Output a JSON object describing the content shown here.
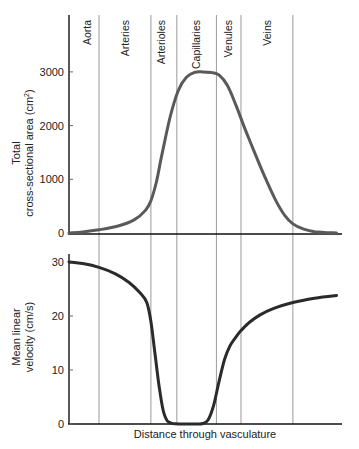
{
  "chart_data": [
    {
      "type": "line",
      "title": "",
      "xlabel": "",
      "ylabel": "Total cross-sectional area (cm²)",
      "ylabel_lines": [
        "Total",
        "cross-sectional area (cm²)"
      ],
      "ylim": [
        0,
        3500
      ],
      "yticks": [
        0,
        1000,
        2000,
        3000
      ],
      "ytick_labels": [
        "0",
        "1000",
        "2000",
        "3000"
      ],
      "grid": false,
      "line_color": "#5a5a5a",
      "x": [
        0,
        5,
        11,
        18,
        24,
        28,
        30,
        32,
        34,
        37,
        40,
        43,
        46,
        49,
        52,
        55,
        58,
        61,
        64,
        67,
        70,
        73,
        76,
        79,
        82,
        86,
        90,
        94,
        98
      ],
      "values": [
        0,
        20,
        60,
        130,
        250,
        420,
        600,
        950,
        1450,
        2150,
        2650,
        2900,
        2990,
        3000,
        2990,
        2940,
        2750,
        2400,
        2000,
        1620,
        1250,
        900,
        580,
        330,
        170,
        70,
        25,
        8,
        0
      ]
    },
    {
      "type": "line",
      "title": "",
      "xlabel": "Distance through vasculature",
      "ylabel": "Mean linear velocity (cm/s)",
      "ylabel_lines": [
        "Mean linear",
        "velocity (cm/s)"
      ],
      "ylim": [
        0,
        32
      ],
      "yticks": [
        0,
        10,
        20,
        30
      ],
      "ytick_labels": [
        "0",
        "10",
        "20",
        "30"
      ],
      "grid": false,
      "line_color": "#2a2a2a",
      "x": [
        0,
        5,
        11,
        17,
        22,
        26,
        28.5,
        30,
        31.5,
        33,
        34.5,
        36,
        38,
        41,
        44,
        47,
        49,
        51,
        53,
        55,
        57,
        59,
        61,
        63,
        66,
        70,
        75,
        82,
        90,
        98
      ],
      "values": [
        30,
        29.7,
        29,
        27.8,
        26.2,
        24.3,
        22.5,
        19,
        13,
        7,
        2.5,
        0.6,
        0.1,
        0,
        0,
        0,
        0.1,
        0.8,
        3.5,
        8,
        12,
        14.5,
        16,
        17.3,
        18.8,
        20.2,
        21.4,
        22.5,
        23.3,
        23.8
      ]
    }
  ],
  "segments": {
    "labels": [
      "Aorta",
      "Arteries",
      "Arterioles",
      "Capillaries",
      "Venules",
      "Veins"
    ],
    "boundaries_x": [
      11,
      30,
      39.5,
      54,
      63,
      82
    ]
  },
  "top_panel": {
    "ylabel_line1": "Total",
    "ylabel_line2": "cross-sectional area (cm²)",
    "ticks": [
      "0",
      "1000",
      "2000",
      "3000"
    ]
  },
  "bottom_panel": {
    "ylabel_line1": "Mean linear",
    "ylabel_line2": "velocity (cm/s)",
    "ticks": [
      "0",
      "10",
      "20",
      "30"
    ],
    "xlabel": "Distance through vasculature"
  }
}
